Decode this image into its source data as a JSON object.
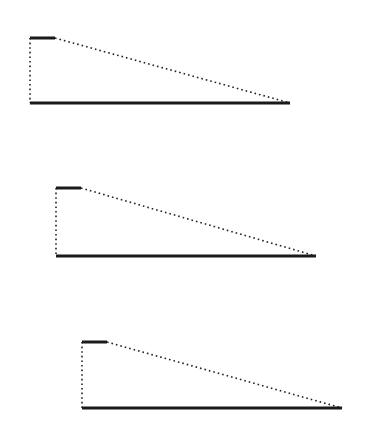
{
  "canvas": {
    "width": 375,
    "height": 440,
    "background": "#ffffff"
  },
  "style": {
    "solid_color": "#1a1a1a",
    "dotted_color": "#222222",
    "solid_width": 3,
    "dotted_width": 1.6,
    "dot_pattern": "1.6 3"
  },
  "figures": [
    {
      "name": "figure-1",
      "top_bar": {
        "x1": 30,
        "x2": 55,
        "y": 38
      },
      "vertical": {
        "x": 30,
        "y1": 38,
        "y2": 103
      },
      "base": {
        "x1": 30,
        "x2": 290,
        "y": 103
      },
      "diagonal": {
        "x1": 55,
        "y1": 38,
        "x2": 290,
        "y2": 103
      }
    },
    {
      "name": "figure-2",
      "top_bar": {
        "x1": 56,
        "x2": 81,
        "y": 188
      },
      "vertical": {
        "x": 56,
        "y1": 188,
        "y2": 256
      },
      "base": {
        "x1": 56,
        "x2": 316,
        "y": 256
      },
      "diagonal": {
        "x1": 81,
        "y1": 188,
        "x2": 316,
        "y2": 256
      }
    },
    {
      "name": "figure-3",
      "top_bar": {
        "x1": 82,
        "x2": 107,
        "y": 342
      },
      "vertical": {
        "x": 82,
        "y1": 342,
        "y2": 408
      },
      "base": {
        "x1": 82,
        "x2": 342,
        "y": 408
      },
      "diagonal": {
        "x1": 107,
        "y1": 342,
        "x2": 342,
        "y2": 408
      }
    }
  ]
}
